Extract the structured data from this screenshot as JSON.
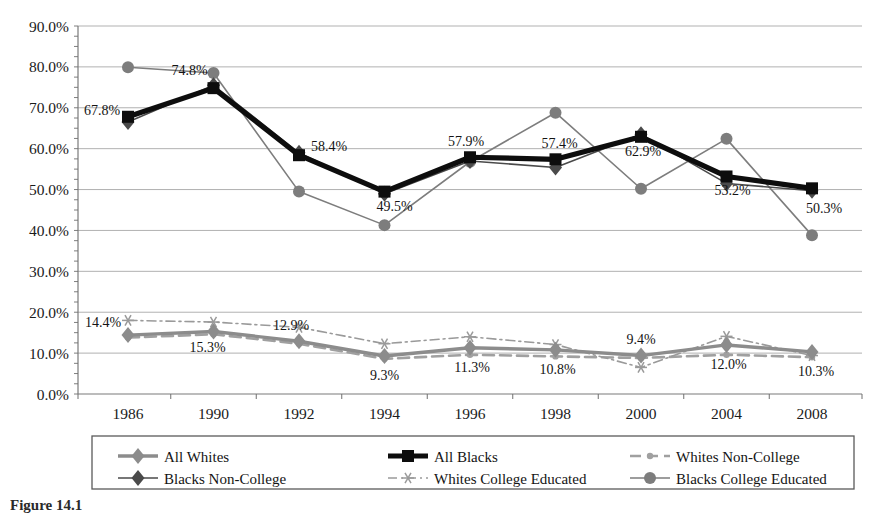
{
  "chart_data": {
    "type": "line",
    "title": "",
    "xlabel": "",
    "ylabel": "",
    "categories": [
      "1986",
      "1990",
      "1992",
      "1994",
      "1996",
      "1998",
      "2000",
      "2004",
      "2008"
    ],
    "ylim": [
      0,
      90
    ],
    "ytick_labels": [
      "0.0%",
      "10.0%",
      "20.0%",
      "30.0%",
      "40.0%",
      "50.0%",
      "60.0%",
      "70.0%",
      "80.0%",
      "90.0%"
    ],
    "ytick_values": [
      0,
      10,
      20,
      30,
      40,
      50,
      60,
      70,
      80,
      90
    ],
    "grid": true,
    "legend_position": "bottom",
    "series": [
      {
        "name": "All Whites",
        "color": "#8c8c8c",
        "marker": "diamond",
        "line": "solid-thick",
        "values": [
          14.4,
          15.3,
          12.9,
          9.3,
          11.3,
          10.8,
          9.4,
          12.0,
          10.3
        ],
        "labels": [
          "14.4%",
          "15.3%",
          "12.9%",
          "9.3%",
          "11.3%",
          "10.8%",
          "9.4%",
          "12.0%",
          "10.3%"
        ]
      },
      {
        "name": "All Blacks",
        "color": "#0d0d0d",
        "marker": "square",
        "line": "solid-extra-thick",
        "values": [
          67.8,
          74.8,
          58.4,
          49.5,
          57.9,
          57.4,
          62.9,
          53.2,
          50.3
        ],
        "labels": [
          "67.8%",
          "74.8%",
          "58.4%",
          "49.5%",
          "57.9%",
          "57.4%",
          "62.9%",
          "53.2%",
          "50.3%"
        ]
      },
      {
        "name": "Whites Non-College",
        "color": "#a0a0a0",
        "marker": "dash-arrow",
        "line": "dashed",
        "values": [
          13.8,
          14.6,
          12.3,
          8.6,
          9.6,
          9.2,
          8.8,
          9.6,
          9.0
        ],
        "labels": []
      },
      {
        "name": "Blacks Non-College",
        "color": "#4a4a4a",
        "marker": "diamond",
        "line": "solid",
        "values": [
          66.5,
          75.5,
          59.0,
          49.0,
          57.0,
          55.4,
          63.5,
          51.5,
          49.7
        ],
        "labels": []
      },
      {
        "name": "Whites College Educated",
        "color": "#9a9a9a",
        "marker": "asterisk",
        "line": "dash-dot",
        "values": [
          18.0,
          17.6,
          16.3,
          12.3,
          14.0,
          12.1,
          6.5,
          14.1,
          9.4
        ],
        "labels": []
      },
      {
        "name": "Blacks College Educated",
        "color": "#7d7d7d",
        "marker": "circle",
        "line": "solid",
        "values": [
          79.9,
          78.5,
          49.5,
          41.3,
          56.8,
          68.8,
          50.2,
          62.4,
          38.8
        ],
        "labels": []
      }
    ]
  },
  "legend": {
    "entries": [
      "All Whites",
      "All Blacks",
      "Whites Non-College",
      "Blacks Non-College",
      "Whites College Educated",
      "Blacks College Educated"
    ]
  },
  "caption": {
    "label": "Figure 14.1",
    "text": "Figure 14.1"
  }
}
